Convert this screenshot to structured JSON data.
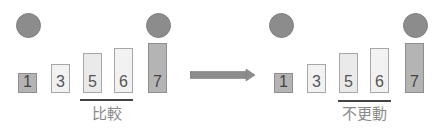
{
  "diagram": {
    "arrow": {
      "direction": "right",
      "color": "#8c8c8c"
    },
    "colors": {
      "circle": "#8c8c8c",
      "sorted_box": "#b4b4b4",
      "unsorted_box": "#f2f2f2",
      "number_text": "#555555",
      "caption_text": "#8a8a8a"
    },
    "before": {
      "boxes": [
        {
          "label": "1",
          "state": "sorted"
        },
        {
          "label": "3",
          "state": "unsorted"
        },
        {
          "label": "5",
          "state": "unsorted"
        },
        {
          "label": "6",
          "state": "unsorted"
        },
        {
          "label": "7",
          "state": "sorted"
        }
      ],
      "caption": "比較"
    },
    "after": {
      "boxes": [
        {
          "label": "1",
          "state": "sorted"
        },
        {
          "label": "3",
          "state": "unsorted"
        },
        {
          "label": "5",
          "state": "unsorted"
        },
        {
          "label": "6",
          "state": "unsorted"
        },
        {
          "label": "7",
          "state": "sorted"
        }
      ],
      "caption": "不更動"
    }
  }
}
